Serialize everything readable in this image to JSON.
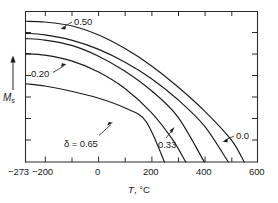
{
  "figure": {
    "background": "#ffffff",
    "ink_color": "#1a1a1a"
  },
  "axes": {
    "x_title_prefix": "T",
    "x_title_suffix": ", °C",
    "y_title_symbol": "M",
    "y_title_subscript": "s",
    "y_axis_arrow": "up-arrow",
    "x_tick_labels": [
      "−273",
      "−200",
      "0",
      "200",
      "400",
      "600"
    ],
    "x_tick_values": [
      -273,
      -200,
      0,
      200,
      400,
      600
    ],
    "x_minor_tick_values": [
      -100,
      100,
      300,
      500
    ],
    "y_tick_count": 7
  },
  "curve_labels": [
    {
      "id": "label-050",
      "text": "0.50"
    },
    {
      "id": "label-020",
      "text": "0.20"
    },
    {
      "id": "label-delta-065",
      "text": "δ = 0.65"
    },
    {
      "id": "label-033",
      "text": "0.33"
    },
    {
      "id": "label-00",
      "text": "0.0"
    }
  ],
  "chart_data": {
    "type": "line",
    "title": "",
    "xlabel": "T, °C",
    "ylabel": "Mₛ",
    "xlim": [
      -273,
      600
    ],
    "ylim": [
      0,
      1.0
    ],
    "grid": false,
    "legend": "inline-annotations",
    "x_tick_labels": [
      "−273",
      "−200",
      "0",
      "200",
      "400",
      "600"
    ],
    "series": [
      {
        "name": "0.50",
        "delta": 0.5,
        "curie_temperature_C": 550,
        "points": [
          {
            "x": -273,
            "y": 0.935
          },
          {
            "x": -200,
            "y": 0.93
          },
          {
            "x": -100,
            "y": 0.905
          },
          {
            "x": 0,
            "y": 0.845
          },
          {
            "x": 100,
            "y": 0.755
          },
          {
            "x": 200,
            "y": 0.64
          },
          {
            "x": 300,
            "y": 0.5
          },
          {
            "x": 400,
            "y": 0.34
          },
          {
            "x": 500,
            "y": 0.15
          },
          {
            "x": 550,
            "y": 0.0
          }
        ]
      },
      {
        "name": "0.0",
        "delta": 0.0,
        "curie_temperature_C": 490,
        "points": [
          {
            "x": -273,
            "y": 0.855
          },
          {
            "x": -200,
            "y": 0.845
          },
          {
            "x": -100,
            "y": 0.81
          },
          {
            "x": 0,
            "y": 0.75
          },
          {
            "x": 100,
            "y": 0.665
          },
          {
            "x": 200,
            "y": 0.555
          },
          {
            "x": 300,
            "y": 0.415
          },
          {
            "x": 400,
            "y": 0.24
          },
          {
            "x": 490,
            "y": 0.0
          }
        ]
      },
      {
        "name": "0.20",
        "delta": 0.2,
        "curie_temperature_C": 400,
        "points": [
          {
            "x": -273,
            "y": 0.82
          },
          {
            "x": -200,
            "y": 0.81
          },
          {
            "x": -100,
            "y": 0.775
          },
          {
            "x": 0,
            "y": 0.705
          },
          {
            "x": 100,
            "y": 0.605
          },
          {
            "x": 200,
            "y": 0.475
          },
          {
            "x": 300,
            "y": 0.3
          },
          {
            "x": 400,
            "y": 0.0
          }
        ]
      },
      {
        "name": "0.33",
        "delta": 0.33,
        "curie_temperature_C": 330,
        "points": [
          {
            "x": -273,
            "y": 0.72
          },
          {
            "x": -200,
            "y": 0.71
          },
          {
            "x": -100,
            "y": 0.672
          },
          {
            "x": 0,
            "y": 0.6
          },
          {
            "x": 100,
            "y": 0.49
          },
          {
            "x": 200,
            "y": 0.33
          },
          {
            "x": 280,
            "y": 0.15
          },
          {
            "x": 330,
            "y": 0.0
          }
        ]
      },
      {
        "name": "0.65",
        "delta": 0.65,
        "curie_temperature_C": 250,
        "points": [
          {
            "x": -273,
            "y": 0.52
          },
          {
            "x": -200,
            "y": 0.505
          },
          {
            "x": -100,
            "y": 0.47
          },
          {
            "x": 0,
            "y": 0.425
          },
          {
            "x": 100,
            "y": 0.36
          },
          {
            "x": 180,
            "y": 0.27
          },
          {
            "x": 250,
            "y": 0.0
          }
        ]
      }
    ]
  }
}
